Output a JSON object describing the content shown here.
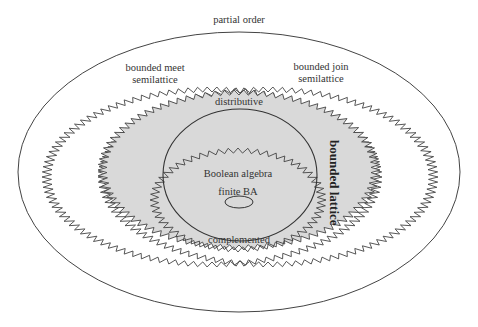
{
  "diagram": {
    "type": "nested-set-diagram",
    "colors": {
      "background": "#ffffff",
      "stroke": "#444444",
      "fill_bounded_lattice": "#d9d9d9"
    },
    "labels": {
      "partial_order": "partial order",
      "bounded_meet_line1": "bounded meet",
      "bounded_meet_line2": "semilattice",
      "bounded_join_line1": "bounded join",
      "bounded_join_line2": "semilattice",
      "distributive": "distributive",
      "bounded_lattice": "bounded lattice",
      "boolean_algebra": "Boolean algebra",
      "finite_ba": "finite BA",
      "complemented": "complemented"
    },
    "regions": [
      {
        "name": "partial order",
        "shape": "ellipse",
        "border": "smooth"
      },
      {
        "name": "bounded meet semilattice",
        "shape": "ellipse",
        "border": "zigzag"
      },
      {
        "name": "bounded join semilattice",
        "shape": "ellipse",
        "border": "zigzag"
      },
      {
        "name": "bounded lattice",
        "shape": "ellipse",
        "border": "zigzag",
        "filled": true
      },
      {
        "name": "distributive",
        "shape": "ellipse",
        "border": "smooth"
      },
      {
        "name": "complemented",
        "shape": "ellipse",
        "border": "zigzag"
      },
      {
        "name": "finite BA",
        "shape": "ellipse",
        "border": "smooth"
      }
    ]
  }
}
